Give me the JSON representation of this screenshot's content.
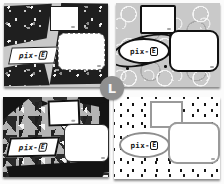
{
  "board": {
    "badge_letter": "L",
    "logo": {
      "prefix": "pix-",
      "boxed_letter": "E"
    },
    "cards": [
      {
        "id": "dark-terrazzo",
        "pattern": "black terrazzo chips on gray",
        "label_shape": "skewed tag"
      },
      {
        "id": "doodle-circles",
        "pattern": "gray doodle circles",
        "label_shape": "ellipse with orbit ring"
      },
      {
        "id": "triangle-confetti",
        "pattern": "gray triangle confetti with black bands",
        "label_shape": "skewed tag"
      },
      {
        "id": "square-dots",
        "pattern": "black square dots on white",
        "label_shape": "ellipse"
      }
    ],
    "colors": {
      "terrazzo_dark": "#1f1f1f",
      "card_gray": "#c9c9c9",
      "confetti_gray": "#b4b4b4",
      "dots_white": "#ffffff",
      "ink_black": "#141414",
      "border_gray": "#9a9a9a",
      "badge_gray": "#8f8f8f"
    }
  }
}
